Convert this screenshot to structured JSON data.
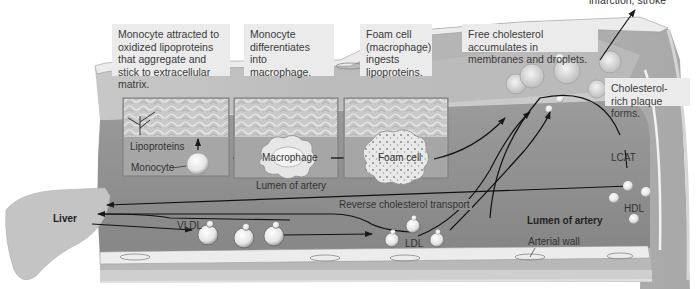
{
  "captions": {
    "step1": "Monocyte attracted to oxidized lipoproteins that aggregate and stick to extracellular matrix.",
    "step2": "Monocyte differentiates into macrophage.",
    "step3": "Foam cell (macrophage) ingests lipoproteins.",
    "step4": "Free cholesterol accumulates in membranes and droplets.",
    "step5": "Cholesterol-rich plaque forms.",
    "top_cut": "infarction, stroke"
  },
  "labels": {
    "lipoproteins": "Lipoproteins",
    "monocyte": "Monocyte",
    "macrophage": "Macrophage",
    "lumen_inset": "Lumen of artery",
    "foam_cell": "Foam cell",
    "liver": "Liver",
    "vldl": "VLDL",
    "ldl": "LDL",
    "hdl": "HDL",
    "lcat": "LCAT",
    "reverse_transport": "Reverse cholesterol transport",
    "lumen_main": "Lumen of artery",
    "arterial_wall": "Arterial wall"
  },
  "colors": {
    "lumen": "#8f8f8f",
    "wall": "#b5b5b5",
    "endothelium": "#ececec",
    "inset_bg": "#a9a9a9",
    "caption_bg": "#ebebeb",
    "liver": "#c4c4c4",
    "arrow": "#1a1a1a"
  }
}
